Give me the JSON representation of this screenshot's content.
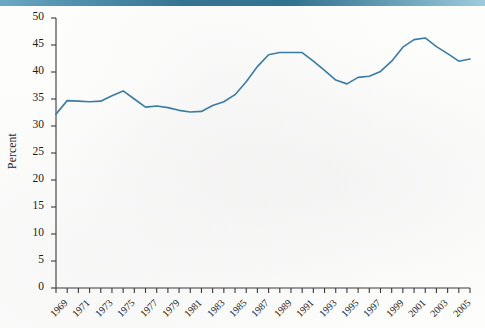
{
  "figure": {
    "banner_color_left": "#6aa8c4",
    "banner_color_mid": "#2d6e8e",
    "banner_color_right": "#9ecbdc",
    "background_color": "#fdfdfc",
    "axis_color": "#3a3a3a",
    "text_color": "#1b1b1b"
  },
  "chart_data": {
    "type": "line",
    "title": "",
    "subtitle": "",
    "xlabel": "",
    "ylabel": "Percent",
    "line_color": "#3a7ca5",
    "line_width": 1.6,
    "grid": false,
    "legend": false,
    "legend_position": "none",
    "xlim": [
      1969,
      2006
    ],
    "ylim": [
      0,
      50
    ],
    "ytick_step": 5,
    "ytick_labels": [
      "0",
      "5",
      "10",
      "15",
      "20",
      "25",
      "30",
      "35",
      "40",
      "45",
      "50"
    ],
    "ytick_values": [
      0,
      5,
      10,
      15,
      20,
      25,
      30,
      35,
      40,
      45,
      50
    ],
    "xtick_values": [
      1969,
      1970,
      1971,
      1972,
      1973,
      1974,
      1975,
      1976,
      1977,
      1978,
      1979,
      1980,
      1981,
      1982,
      1983,
      1984,
      1985,
      1986,
      1987,
      1988,
      1989,
      1990,
      1991,
      1992,
      1993,
      1994,
      1995,
      1996,
      1997,
      1998,
      1999,
      2000,
      2001,
      2002,
      2003,
      2004,
      2005,
      2006
    ],
    "xtick_labels": [
      "1969",
      "1971",
      "1973",
      "1975",
      "1977",
      "1979",
      "1981",
      "1983",
      "1985",
      "1987",
      "1989",
      "1991",
      "1993",
      "1995",
      "1997",
      "1999",
      "2001",
      "2003",
      "2005"
    ],
    "xtick_labeled_values": [
      1969,
      1971,
      1973,
      1975,
      1977,
      1979,
      1981,
      1983,
      1985,
      1987,
      1989,
      1991,
      1993,
      1995,
      1997,
      1999,
      2001,
      2003,
      2005
    ],
    "x": [
      1969,
      1970,
      1971,
      1972,
      1973,
      1974,
      1975,
      1976,
      1977,
      1978,
      1979,
      1980,
      1981,
      1982,
      1983,
      1984,
      1985,
      1986,
      1987,
      1988,
      1989,
      1990,
      1991,
      1992,
      1993,
      1994,
      1995,
      1996,
      1997,
      1998,
      1999,
      2000,
      2001,
      2002,
      2003,
      2004,
      2005,
      2006
    ],
    "values": [
      32.2,
      34.7,
      34.6,
      34.5,
      34.6,
      35.6,
      36.5,
      35.0,
      33.5,
      33.7,
      33.4,
      32.9,
      32.6,
      32.7,
      33.8,
      34.5,
      35.8,
      38.2,
      41.0,
      43.2,
      43.6,
      43.6,
      43.6,
      42.0,
      40.3,
      38.5,
      37.8,
      39.0,
      39.2,
      40.1,
      42.0,
      44.6,
      46.0,
      46.3,
      44.7,
      43.4,
      42.0,
      42.4
    ]
  }
}
